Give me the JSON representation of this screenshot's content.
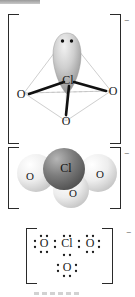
{
  "diagram": {
    "ion_charge": "−",
    "panels": [
      {
        "id": "ball-and-stick",
        "name": "tetrahedral-ball-and-stick-model",
        "charge": "−",
        "center_atom": "Cl",
        "ligand_atoms": [
          "O",
          "O",
          "O"
        ],
        "lone_pair_label": "lone-pair-lobe",
        "lone_pair_dots": 2
      },
      {
        "id": "space-filling",
        "name": "space-filling-model",
        "charge": "−",
        "center_atom": "Cl",
        "ligand_atoms": [
          "O",
          "O",
          "O"
        ],
        "colors": {
          "chlorine": "#6e6e6e",
          "oxygen": "#e8e8e8"
        }
      },
      {
        "id": "lewis",
        "name": "lewis-dot-structure",
        "charge": "−",
        "center_atom": "Cl",
        "top_left_atom": "O",
        "top_right_atom": "O",
        "bottom_atom": "O"
      }
    ]
  },
  "atoms": {
    "cl": "Cl",
    "o": "O"
  }
}
